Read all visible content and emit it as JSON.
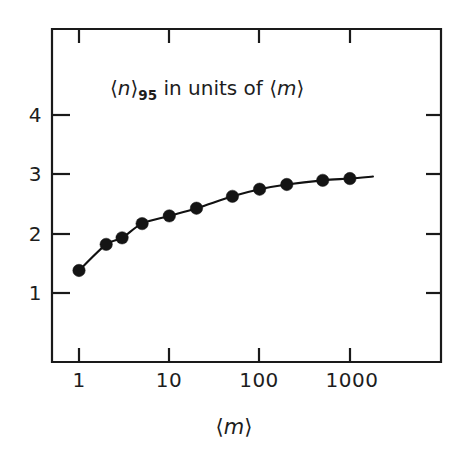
{
  "chart_data": {
    "type": "line",
    "title": "⟨n⟩95 in units of ⟨m⟩",
    "title_parts": {
      "bracket_open": "⟨",
      "symbol": "n",
      "bracket_close": "⟩",
      "subscript": "95",
      "middle": " in units of ",
      "bracket_open2": "⟨",
      "symbol2": "m",
      "bracket_close2": "⟩"
    },
    "xlabel": "⟨m⟩",
    "ylabel": "",
    "xscale": "log",
    "yscale": "linear",
    "xlim": [
      0.55,
      3200
    ],
    "ylim": [
      0.0,
      4.6
    ],
    "grid": false,
    "legend": null,
    "xticks": [
      1,
      10,
      100,
      1000
    ],
    "xtick_labels": [
      "1",
      "10",
      "100",
      "1000"
    ],
    "yticks": [
      1,
      2,
      3,
      4
    ],
    "ytick_labels": [
      "1",
      "2",
      "3",
      "4"
    ],
    "x": [
      1,
      2,
      3,
      5,
      10,
      20,
      50,
      100,
      200,
      500,
      1000
    ],
    "values": [
      1.38,
      1.82,
      1.93,
      2.17,
      2.3,
      2.43,
      2.63,
      2.75,
      2.83,
      2.9,
      2.93
    ],
    "marker": "filled-circle",
    "marker_color": "#141414",
    "line_color": "#111111",
    "frame_color": "#1a1a1a",
    "background_color": "#ffffff",
    "curve_extends_beyond_last_point": true,
    "curve_x_end": 1800
  },
  "axis_labels": {
    "x_axis_caption": "⟨m⟩"
  }
}
